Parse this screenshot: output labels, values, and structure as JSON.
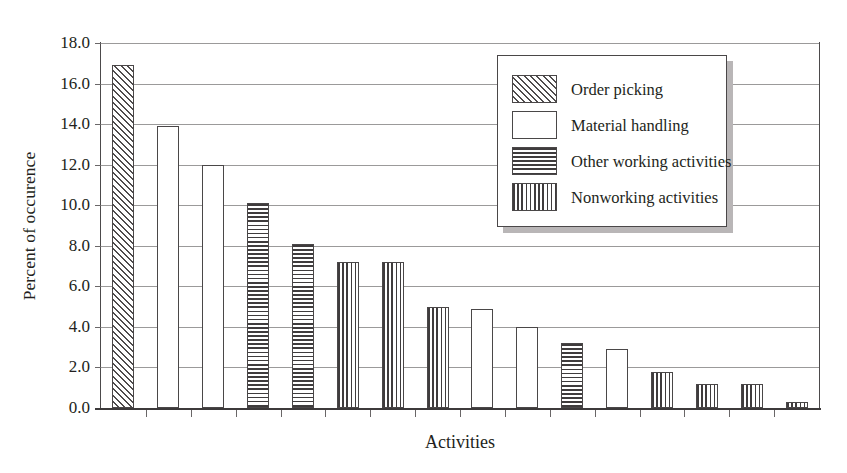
{
  "chart_data": {
    "type": "bar",
    "title": "",
    "xlabel": "Activities",
    "ylabel": "Percent of occurence",
    "ylim": [
      0.0,
      18.0
    ],
    "ytick_step": 2.0,
    "ytick_labels": [
      "18.0",
      "16.0",
      "14.0",
      "12.0",
      "10.0",
      "8.0",
      "6.0",
      "4.0",
      "2.0",
      "0.0"
    ],
    "ytick_values": [
      18.0,
      16.0,
      14.0,
      12.0,
      10.0,
      8.0,
      6.0,
      4.0,
      2.0,
      0.0
    ],
    "grid": true,
    "grid_axis": "y",
    "xtick_labels": [],
    "legend_position": "upper-center-right",
    "legend": [
      {
        "label": "Order picking",
        "pattern": "diagonal-hatch"
      },
      {
        "label": "Material handling",
        "pattern": "stipple-dots"
      },
      {
        "label": "Other working activities",
        "pattern": "horizontal-lines"
      },
      {
        "label": "Nonworking activities",
        "pattern": "vertical-lines"
      }
    ],
    "categories": [
      "1",
      "2",
      "3",
      "4",
      "5",
      "6",
      "7",
      "8",
      "9",
      "10",
      "11",
      "12",
      "13",
      "14",
      "15",
      "16"
    ],
    "values": [
      16.9,
      13.9,
      12.0,
      10.1,
      8.1,
      7.2,
      7.2,
      5.0,
      4.9,
      4.0,
      3.2,
      2.9,
      1.8,
      1.2,
      1.2,
      0.3
    ],
    "bars": [
      {
        "index": 1,
        "value": 16.9,
        "series": "Order picking",
        "pattern": "diagonal-hatch"
      },
      {
        "index": 2,
        "value": 13.9,
        "series": "Material handling",
        "pattern": "stipple-dots"
      },
      {
        "index": 3,
        "value": 12.0,
        "series": "Material handling",
        "pattern": "stipple-dots"
      },
      {
        "index": 4,
        "value": 10.1,
        "series": "Other working activities",
        "pattern": "horizontal-lines"
      },
      {
        "index": 5,
        "value": 8.1,
        "series": "Other working activities",
        "pattern": "horizontal-lines"
      },
      {
        "index": 6,
        "value": 7.2,
        "series": "Nonworking activities",
        "pattern": "vertical-lines"
      },
      {
        "index": 7,
        "value": 7.2,
        "series": "Nonworking activities",
        "pattern": "vertical-lines"
      },
      {
        "index": 8,
        "value": 5.0,
        "series": "Nonworking activities",
        "pattern": "vertical-lines"
      },
      {
        "index": 9,
        "value": 4.9,
        "series": "Material handling",
        "pattern": "stipple-dots"
      },
      {
        "index": 10,
        "value": 4.0,
        "series": "Material handling",
        "pattern": "stipple-dots"
      },
      {
        "index": 11,
        "value": 3.2,
        "series": "Other working activities",
        "pattern": "horizontal-lines"
      },
      {
        "index": 12,
        "value": 2.9,
        "series": "Material handling",
        "pattern": "stipple-dots"
      },
      {
        "index": 13,
        "value": 1.8,
        "series": "Nonworking activities",
        "pattern": "vertical-lines"
      },
      {
        "index": 14,
        "value": 1.2,
        "series": "Nonworking activities",
        "pattern": "vertical-lines"
      },
      {
        "index": 15,
        "value": 1.2,
        "series": "Nonworking activities",
        "pattern": "vertical-lines"
      },
      {
        "index": 16,
        "value": 0.3,
        "series": "Nonworking activities",
        "pattern": "vertical-lines"
      }
    ],
    "colors": {
      "ink": "#231f20",
      "gridline": "#9b9a9a",
      "spine": "#4c4a4b",
      "bar_edge": "#4a4748",
      "bar_fill": "#ffffff",
      "legend_shadow": "#b9b6b7",
      "background": "#ffffff"
    }
  }
}
